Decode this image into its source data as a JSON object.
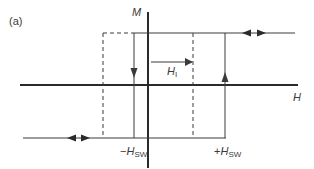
{
  "figure": {
    "panel_label": "(a)",
    "axes": {
      "vertical_label": "M",
      "horizontal_label": "H"
    },
    "field_labels": {
      "internal_field": {
        "symbol": "H",
        "subscript": "I"
      },
      "neg_switching": {
        "sign": "−",
        "symbol": "H",
        "subscript": "SW"
      },
      "pos_switching": {
        "sign": "+",
        "symbol": "H",
        "subscript": "SW"
      }
    },
    "colors": {
      "line": "#3a3a3a",
      "axis": "#2a2a2a",
      "background": "#ffffff"
    }
  }
}
